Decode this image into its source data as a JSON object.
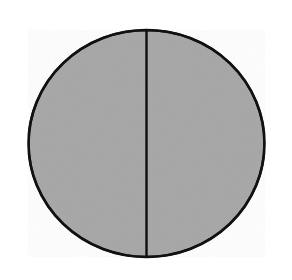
{
  "chart_data": {
    "type": "pie",
    "title": "",
    "categories": [
      "",
      ""
    ],
    "values": [
      50,
      50
    ],
    "labels_visible": false,
    "legend": "none",
    "slice_fill": "#a9a9a9",
    "edge_color": "#111111",
    "start_angle_deg": 90,
    "divider": "vertical"
  }
}
